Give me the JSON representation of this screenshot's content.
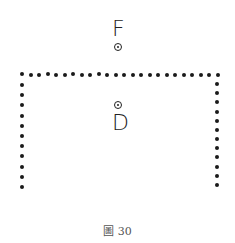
{
  "figure": {
    "labels": {
      "top": "F",
      "center": "D"
    },
    "caption": {
      "prefix": "圖",
      "number": "30"
    },
    "colors": {
      "ink": "#1a1a1a",
      "caption": "#555555",
      "background": "#ffffff"
    },
    "shape": "dotted inverted-U (top edge with two vertical sides)",
    "top_edge_dots": 24,
    "left_side_dots": 11,
    "right_side_dots": 12
  }
}
